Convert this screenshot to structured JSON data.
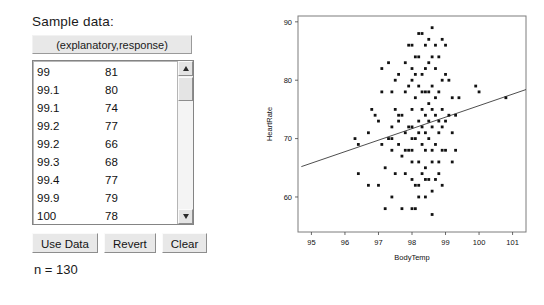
{
  "panel": {
    "title": "Sample data:",
    "header_button": "(explanatory,response)",
    "columns": [
      "explanatory",
      "response"
    ],
    "visible_rows": [
      {
        "x": "99",
        "y": "81"
      },
      {
        "x": "99.1",
        "y": "80"
      },
      {
        "x": "99.1",
        "y": "74"
      },
      {
        "x": "99.2",
        "y": "77"
      },
      {
        "x": "99.2",
        "y": "66"
      },
      {
        "x": "99.3",
        "y": "68"
      },
      {
        "x": "99.4",
        "y": "77"
      },
      {
        "x": "99.9",
        "y": "79"
      },
      {
        "x": "100",
        "y": "78"
      },
      {
        "x": "100.8",
        "y": "77"
      }
    ],
    "buttons": [
      {
        "label": "Use Data",
        "name": "use-data-button"
      },
      {
        "label": "Revert",
        "name": "revert-button"
      },
      {
        "label": "Clear",
        "name": "clear-button"
      }
    ],
    "sample_size_label": "n = 130",
    "scrollbar": {
      "up_icon": "arrow-up-icon",
      "down_icon": "arrow-down-icon",
      "thumb_name": "scrollbar-thumb"
    }
  },
  "chart_data": {
    "type": "scatter",
    "title": "",
    "xlabel": "BodyTemp",
    "ylabel": "HeartRate",
    "xlim": [
      94.6,
      101.4
    ],
    "ylim": [
      54,
      91
    ],
    "xticks": [
      "95",
      "96",
      "97",
      "98",
      "99",
      "100",
      "101"
    ],
    "yticks": [
      "60",
      "70",
      "80",
      "90"
    ],
    "grid": false,
    "legend": "none",
    "regression_line": {
      "x1": 94.7,
      "y1": 65.2,
      "x2": 101.4,
      "y2": 78.4
    },
    "points": [
      [
        96.3,
        70
      ],
      [
        96.4,
        69
      ],
      [
        96.7,
        71
      ],
      [
        96.7,
        62
      ],
      [
        96.8,
        75
      ],
      [
        96.9,
        74
      ],
      [
        97.0,
        73
      ],
      [
        97.1,
        82
      ],
      [
        97.1,
        78
      ],
      [
        97.1,
        69
      ],
      [
        97.2,
        58
      ],
      [
        97.3,
        70
      ],
      [
        97.4,
        68
      ],
      [
        97.4,
        72
      ],
      [
        97.4,
        78
      ],
      [
        97.4,
        70
      ],
      [
        97.5,
        80
      ],
      [
        97.5,
        75
      ],
      [
        97.6,
        74
      ],
      [
        97.6,
        69
      ],
      [
        97.6,
        73
      ],
      [
        97.7,
        58
      ],
      [
        97.7,
        74
      ],
      [
        97.8,
        71
      ],
      [
        97.8,
        64
      ],
      [
        97.8,
        78
      ],
      [
        97.8,
        83
      ],
      [
        97.9,
        72
      ],
      [
        97.9,
        68
      ],
      [
        97.9,
        79
      ],
      [
        98.0,
        66
      ],
      [
        98.0,
        72
      ],
      [
        98.0,
        80
      ],
      [
        98.0,
        75
      ],
      [
        98.0,
        82
      ],
      [
        98.0,
        68
      ],
      [
        98.0,
        58
      ],
      [
        98.1,
        62
      ],
      [
        98.1,
        70
      ],
      [
        98.1,
        77
      ],
      [
        98.2,
        73
      ],
      [
        98.2,
        66
      ],
      [
        98.2,
        79
      ],
      [
        98.2,
        71
      ],
      [
        98.2,
        60
      ],
      [
        98.3,
        75
      ],
      [
        98.3,
        88
      ],
      [
        98.3,
        64
      ],
      [
        98.3,
        72
      ],
      [
        98.4,
        68
      ],
      [
        98.4,
        78
      ],
      [
        98.4,
        86
      ],
      [
        98.4,
        71
      ],
      [
        98.4,
        65
      ],
      [
        98.4,
        74
      ],
      [
        98.5,
        76
      ],
      [
        98.5,
        70
      ],
      [
        98.5,
        83
      ],
      [
        98.5,
        63
      ],
      [
        98.6,
        75
      ],
      [
        98.6,
        68
      ],
      [
        98.6,
        79
      ],
      [
        98.6,
        72
      ],
      [
        98.6,
        89
      ],
      [
        98.6,
        61
      ],
      [
        98.7,
        74
      ],
      [
        98.7,
        82
      ],
      [
        98.7,
        69
      ],
      [
        98.7,
        77
      ],
      [
        98.8,
        71
      ],
      [
        98.8,
        84
      ],
      [
        98.8,
        64
      ],
      [
        98.8,
        78
      ],
      [
        98.8,
        73
      ],
      [
        98.9,
        80
      ],
      [
        98.9,
        68
      ],
      [
        98.9,
        75
      ],
      [
        99.0,
        81
      ],
      [
        99.0,
        73
      ],
      [
        99.0,
        86
      ],
      [
        99.1,
        80
      ],
      [
        99.1,
        74
      ],
      [
        99.2,
        77
      ],
      [
        99.2,
        66
      ],
      [
        99.3,
        68
      ],
      [
        99.4,
        77
      ],
      [
        99.9,
        79
      ],
      [
        100.0,
        78
      ],
      [
        100.8,
        77
      ],
      [
        97.2,
        65
      ],
      [
        97.3,
        83
      ],
      [
        98.1,
        84
      ],
      [
        98.3,
        81
      ],
      [
        98.5,
        87
      ],
      [
        98.9,
        62
      ],
      [
        98.2,
        84
      ],
      [
        97.9,
        86
      ],
      [
        98.7,
        63
      ],
      [
        99.0,
        68
      ],
      [
        98.1,
        58
      ],
      [
        98.4,
        60
      ],
      [
        98.6,
        66
      ],
      [
        98.3,
        69
      ],
      [
        98.5,
        73
      ],
      [
        98.0,
        86
      ],
      [
        97.6,
        81
      ],
      [
        98.2,
        88
      ],
      [
        98.9,
        87
      ],
      [
        99.2,
        71
      ],
      [
        96.4,
        64
      ],
      [
        97.0,
        62
      ],
      [
        97.5,
        64
      ],
      [
        98.7,
        86
      ],
      [
        98.8,
        66
      ],
      [
        98.4,
        82
      ],
      [
        98.1,
        81
      ],
      [
        97.8,
        68
      ],
      [
        97.7,
        67
      ],
      [
        98.0,
        70
      ],
      [
        98.3,
        78
      ],
      [
        98.5,
        78
      ],
      [
        98.6,
        84
      ],
      [
        98.2,
        62
      ],
      [
        98.4,
        63
      ],
      [
        98.9,
        72
      ],
      [
        99.3,
        74
      ],
      [
        97.4,
        60
      ],
      [
        98.0,
        63
      ],
      [
        98.6,
        57
      ]
    ]
  }
}
